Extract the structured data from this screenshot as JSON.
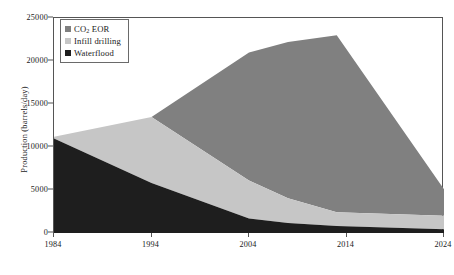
{
  "chart_data": {
    "type": "area",
    "stacked": true,
    "title": "",
    "xlabel": "",
    "ylabel": "Production (barrels/day)",
    "xlim": [
      1984,
      2024
    ],
    "ylim": [
      0,
      25000
    ],
    "x_ticks": [
      1984,
      1994,
      2004,
      2014,
      2024
    ],
    "y_ticks": [
      0,
      5000,
      10000,
      15000,
      20000,
      25000
    ],
    "grid": false,
    "legend_position": "top-left",
    "x": [
      1984,
      1994,
      2004,
      2008,
      2013,
      2024
    ],
    "series": [
      {
        "name": "Waterflood",
        "legend_label": "Waterflood",
        "color": "#1e1e1e",
        "values": [
          11000,
          5800,
          1700,
          1150,
          800,
          450
        ]
      },
      {
        "name": "Infill drilling",
        "legend_label": "Infill drilling",
        "color": "#c6c6c6",
        "values": [
          200,
          7700,
          4400,
          2900,
          1600,
          1550
        ]
      },
      {
        "name": "CO2 EOR",
        "legend_label_prefix": "CO",
        "legend_label_sub": "2",
        "legend_label_suffix": " EOR",
        "color": "#808080",
        "values": [
          0,
          0,
          14900,
          18150,
          20600,
          3100
        ]
      }
    ],
    "stack_totals": [
      11200,
      13500,
      21000,
      22200,
      23000,
      5100
    ]
  },
  "axis": {
    "y_tick_labels": [
      "0",
      "5000",
      "10000",
      "15000",
      "20000",
      "25000"
    ],
    "x_tick_labels": [
      "1984",
      "1994",
      "2004",
      "2014",
      "2024"
    ]
  },
  "colors": {
    "waterflood": "#1e1e1e",
    "infill": "#c6c6c6",
    "co2eor": "#808080",
    "frame": "#555555",
    "background": "#ffffff",
    "text": "#1a1a1a"
  }
}
